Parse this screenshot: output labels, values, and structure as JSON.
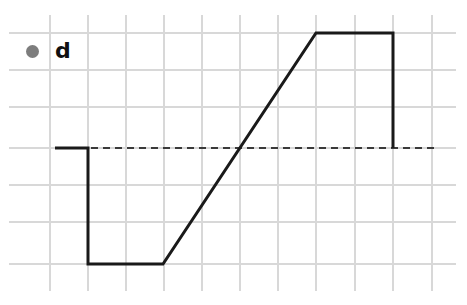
{
  "figure": {
    "width": 467,
    "height": 305,
    "background_color": "#ffffff"
  },
  "legend": {
    "marker_icon": "filled-circle-icon",
    "marker_color": "#7d7d7d",
    "label": "d",
    "position": "top-left"
  },
  "colors": {
    "signal": "#1a1a1a",
    "grid": "#d8d8d8",
    "zero_line": "#3a3a3a",
    "legend_marker": "#7d7d7d"
  },
  "chart_data": {
    "type": "line",
    "title": "d",
    "xlabel": "",
    "ylabel": "",
    "xlim": [
      0,
      10
    ],
    "ylim": [
      -3,
      3
    ],
    "grid": true,
    "legend_position": "upper left",
    "zero_reference": {
      "value": 0,
      "style": "dashed",
      "x_start": 0.2,
      "x_end": 10.2
    },
    "xticks": [
      0,
      1,
      2,
      3,
      4,
      5,
      6,
      7,
      8,
      9,
      10
    ],
    "yticks": [
      -3,
      -2,
      -1,
      0,
      1,
      2,
      3
    ],
    "xticklabels": [
      "",
      "",
      "",
      "",
      "",
      "",
      "",
      "",
      "",
      "",
      ""
    ],
    "yticklabels": [
      "",
      "",
      "",
      "",
      "",
      "",
      ""
    ],
    "series": [
      {
        "name": "d",
        "color": "#1a1a1a",
        "linewidth": 3,
        "x": [
          0.15,
          1.0,
          1.0,
          3.0,
          7.0,
          9.0,
          9.0
        ],
        "y": [
          0.0,
          0.0,
          -3.0,
          -3.0,
          3.0,
          3.0,
          0.0
        ],
        "description": "Step down to minimum, hold, linear ramp up to maximum, hold, step down to zero"
      }
    ],
    "annotations": []
  },
  "geometry": {
    "grid_vertical_x": [
      50,
      88,
      126,
      164,
      202,
      240,
      278,
      316,
      355,
      393,
      432
    ],
    "grid_horizontal_y": [
      33,
      70,
      107,
      148,
      185,
      222,
      264
    ],
    "grid_v_top": 15,
    "grid_v_bottom": 291,
    "grid_h_left": 9,
    "grid_h_right": 456,
    "zero_y": 148,
    "zero_x_start": 55,
    "zero_x_end": 438,
    "signal_points": "55,148 88,148 88,264 163,264 316,33 393,33 393,148"
  }
}
